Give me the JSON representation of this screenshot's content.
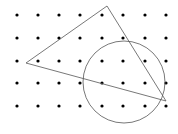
{
  "diagram": {
    "background": "#ffffff",
    "dot_color": "#000000",
    "line_color": "#555555",
    "dot_grid": {
      "columns_x": [
        17,
        38,
        59,
        80,
        102,
        123,
        145,
        166
      ],
      "rows_y": [
        15,
        38,
        61,
        83,
        106
      ],
      "dot_radius": 1.6
    },
    "triangle": {
      "vertices": [
        [
          107,
          6
        ],
        [
          26,
          63
        ],
        [
          166,
          101
        ]
      ]
    },
    "circle": {
      "cx": 124,
      "cy": 82,
      "r": 41
    }
  }
}
